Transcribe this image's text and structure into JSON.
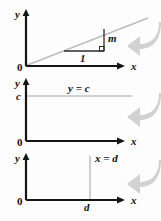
{
  "figure": {
    "axis_color": "#1a1a1a",
    "line_color": "#b9b9b9",
    "arrow_color": "#cfcfcf",
    "text_color": "#1a1a1a"
  },
  "panels": [
    {
      "id": "slope",
      "description": "Line through origin with slope triangle",
      "y_axis_label": "y",
      "x_axis_label": "x",
      "origin_label": "0",
      "run_label": "1",
      "rise_label": "m",
      "right_angle_marker": true,
      "arrow_icon": "curved-arrow-left"
    },
    {
      "id": "horizontal",
      "description": "Horizontal line y equals c",
      "y_axis_label": "y",
      "x_axis_label": "x",
      "origin_label": "0",
      "intercept_label": "c",
      "equation_label": "y = c",
      "arrow_icon": "curved-arrow-left"
    },
    {
      "id": "vertical",
      "description": "Vertical line x equals d",
      "y_axis_label": "y",
      "x_axis_label": "x",
      "origin_label": "0",
      "intercept_label": "d",
      "equation_label": "x = d",
      "arrow_icon": "curved-arrow-left"
    }
  ]
}
